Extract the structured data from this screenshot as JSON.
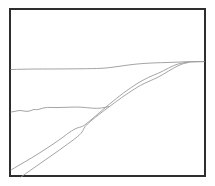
{
  "figure": {
    "background_color": "#ffffff",
    "line_color": "#9a9a9a",
    "border_color": "#2e2e2e",
    "border_width_px": 2,
    "canvas": {
      "width": 215,
      "height": 186
    },
    "frame": {
      "x": 9,
      "y": 8,
      "width": 197,
      "height": 169
    }
  },
  "chart_data": {
    "type": "line",
    "xlabel": "",
    "ylabel": "",
    "xlim": [
      9,
      206
    ],
    "ylim": [
      177,
      8
    ],
    "grid": false,
    "legend": "none",
    "series": [
      {
        "name": "upper-horizon-line",
        "color": "#9a9a9a",
        "points": [
          [
            11,
            69.5
          ],
          [
            22,
            69.2
          ],
          [
            35,
            69.0
          ],
          [
            50,
            69.0
          ],
          [
            66,
            68.9
          ],
          [
            80,
            68.8
          ],
          [
            93,
            68.6
          ],
          [
            100,
            68.4
          ],
          [
            106,
            68.0
          ],
          [
            112,
            67.3
          ],
          [
            118,
            66.5
          ],
          [
            124,
            65.6
          ],
          [
            130,
            64.8
          ],
          [
            136,
            64.1
          ],
          [
            142,
            63.6
          ],
          [
            148,
            63.2
          ],
          [
            154,
            62.9
          ],
          [
            160,
            62.7
          ],
          [
            168,
            62.5
          ],
          [
            176,
            62.2
          ],
          [
            184,
            61.8
          ],
          [
            192,
            61.6
          ],
          [
            199,
            61.5
          ],
          [
            204,
            61.5
          ]
        ]
      },
      {
        "name": "mid-ground-wavy-ridge",
        "color": "#9a9a9a",
        "points": [
          [
            11,
            112.0
          ],
          [
            15,
            111.4
          ],
          [
            19,
            110.4
          ],
          [
            23,
            110.8
          ],
          [
            27,
            111.6
          ],
          [
            31,
            110.6
          ],
          [
            34,
            109.2
          ],
          [
            37,
            110.0
          ],
          [
            41,
            108.6
          ],
          [
            45,
            107.6
          ],
          [
            50,
            107.4
          ],
          [
            56,
            107.6
          ],
          [
            62,
            107.4
          ],
          [
            70,
            107.2
          ],
          [
            78,
            107.0
          ],
          [
            84,
            107.4
          ],
          [
            89,
            107.9
          ],
          [
            94,
            108.3
          ],
          [
            99,
            108.3
          ],
          [
            104,
            107.6
          ],
          [
            109,
            106.6
          ]
        ]
      },
      {
        "name": "upper-diagonal-ridge",
        "color": "#9a9a9a",
        "points": [
          [
            11,
            170.0
          ],
          [
            18,
            165.8
          ],
          [
            26,
            161.2
          ],
          [
            34,
            156.4
          ],
          [
            42,
            151.4
          ],
          [
            50,
            146.2
          ],
          [
            58,
            140.8
          ],
          [
            64,
            136.4
          ],
          [
            69,
            132.6
          ],
          [
            74,
            129.4
          ],
          [
            78,
            127.6
          ],
          [
            81,
            127.0
          ],
          [
            84,
            125.6
          ],
          [
            88,
            122.4
          ],
          [
            93,
            118.2
          ],
          [
            99,
            113.0
          ],
          [
            106,
            107.0
          ],
          [
            113,
            101.2
          ],
          [
            120,
            95.6
          ],
          [
            127,
            90.4
          ],
          [
            134,
            85.6
          ],
          [
            140,
            81.8
          ],
          [
            146,
            78.6
          ],
          [
            151,
            76.2
          ],
          [
            156,
            74.2
          ],
          [
            161,
            72.0
          ],
          [
            166,
            69.4
          ],
          [
            171,
            66.8
          ],
          [
            176,
            64.6
          ],
          [
            181,
            63.2
          ],
          [
            186,
            62.4
          ],
          [
            192,
            62.0
          ],
          [
            199,
            61.8
          ],
          [
            204,
            61.7
          ]
        ]
      },
      {
        "name": "lower-diagonal-ridge",
        "color": "#9a9a9a",
        "points": [
          [
            21,
            177.0
          ],
          [
            30,
            170.6
          ],
          [
            40,
            163.6
          ],
          [
            50,
            156.6
          ],
          [
            60,
            149.6
          ],
          [
            68,
            143.8
          ],
          [
            74,
            139.4
          ],
          [
            78,
            136.2
          ],
          [
            81,
            133.4
          ],
          [
            83,
            130.6
          ],
          [
            84,
            128.0
          ],
          [
            86,
            125.4
          ],
          [
            89,
            122.6
          ],
          [
            93,
            119.2
          ],
          [
            98,
            115.2
          ],
          [
            104,
            110.6
          ],
          [
            111,
            105.4
          ],
          [
            118,
            100.2
          ],
          [
            125,
            95.2
          ],
          [
            132,
            90.6
          ],
          [
            138,
            86.8
          ],
          [
            143,
            84.0
          ],
          [
            147,
            82.2
          ],
          [
            151,
            80.4
          ],
          [
            156,
            78.2
          ],
          [
            161,
            75.6
          ],
          [
            166,
            72.6
          ],
          [
            171,
            69.6
          ],
          [
            176,
            66.8
          ],
          [
            180,
            64.8
          ],
          [
            184,
            63.4
          ],
          [
            188,
            62.6
          ]
        ]
      }
    ]
  }
}
